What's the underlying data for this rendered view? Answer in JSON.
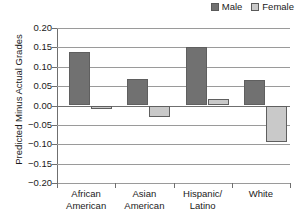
{
  "chart_data": {
    "type": "bar",
    "title": "",
    "xlabel": "",
    "ylabel": "Predicted Minus Actual Grades",
    "ylim": [
      -0.2,
      0.2
    ],
    "ytick_step": 0.05,
    "grid": true,
    "legend_position": "top-right",
    "categories": [
      "African American",
      "Asian American",
      "Hispanic/ Latino",
      "White"
    ],
    "category_lines": [
      [
        "African",
        "American"
      ],
      [
        "Asian",
        "American"
      ],
      [
        "Hispanic/",
        "Latino"
      ],
      [
        "White",
        ""
      ]
    ],
    "series": [
      {
        "name": "Male",
        "color": "#717171",
        "values": [
          0.138,
          0.068,
          0.151,
          0.067
        ]
      },
      {
        "name": "Female",
        "color": "#c9c9c9",
        "values": [
          -0.008,
          -0.03,
          0.016,
          -0.095
        ]
      }
    ],
    "ytick_labels": [
      "0.20",
      "0.15",
      "0.10",
      "0.05",
      "0.00",
      "−0.05",
      "−0.10",
      "−0.15",
      "−0.20"
    ],
    "ytick_values": [
      0.2,
      0.15,
      0.1,
      0.05,
      0.0,
      -0.05,
      -0.1,
      -0.15,
      -0.2
    ]
  },
  "legend": {
    "items": [
      {
        "label": "Male",
        "swatch_color": "#717171"
      },
      {
        "label": "Female",
        "swatch_color": "#c9c9c9"
      }
    ]
  },
  "axis": {
    "y_title": "Predicted Minus Actual Grades"
  }
}
